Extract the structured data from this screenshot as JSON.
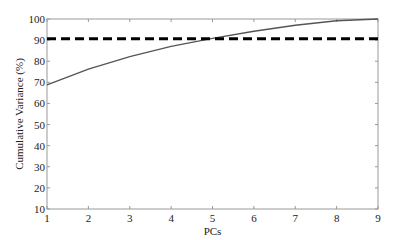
{
  "chart_data": {
    "type": "line",
    "title": "",
    "xlabel": "PCs",
    "ylabel": "Cumulative Variance (%)",
    "xlim": [
      1,
      9
    ],
    "ylim": [
      10,
      100
    ],
    "x_ticks": [
      1,
      2,
      3,
      4,
      5,
      6,
      7,
      8,
      9
    ],
    "y_ticks": [
      10,
      20,
      30,
      40,
      50,
      60,
      70,
      80,
      90,
      100
    ],
    "grid": false,
    "legend": null,
    "x": [
      1,
      2,
      3,
      4,
      5,
      6,
      7,
      8,
      9
    ],
    "series": [
      {
        "name": "Cumulative variance",
        "style": "solid",
        "color": "#555555",
        "values": [
          68.8,
          76.2,
          82.2,
          87.0,
          90.8,
          94.2,
          97.0,
          99.2,
          100.0
        ]
      },
      {
        "name": "Threshold",
        "style": "dashed",
        "color": "#000000",
        "values": [
          90.6,
          90.6,
          90.6,
          90.6,
          90.6,
          90.6,
          90.6,
          90.6,
          90.6
        ]
      }
    ]
  },
  "layout": {
    "plot": {
      "left": 47,
      "right": 378,
      "top": 19,
      "bottom": 209
    }
  }
}
